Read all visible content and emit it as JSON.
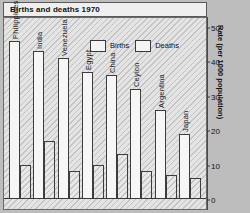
{
  "title": "Births and deaths 1970",
  "legend": {
    "position": "top-center",
    "items": [
      {
        "label": "Births",
        "swatch": "births-swatch"
      },
      {
        "label": "Deaths",
        "swatch": "deaths-swatch"
      }
    ]
  },
  "axis": {
    "ylabel": "Rate (per 1000 population)",
    "ticks": [
      "0",
      "10",
      "20",
      "30",
      "40",
      "50"
    ]
  },
  "chart_data": {
    "type": "bar",
    "title": "Births and deaths 1970",
    "xlabel": "",
    "ylabel": "Rate (per 1000 population)",
    "ylim": [
      0,
      50
    ],
    "yticks": [
      0,
      10,
      20,
      30,
      40,
      50
    ],
    "grid": false,
    "legend_position": "top-center",
    "categories": [
      "Philippines",
      "India",
      "Venezuela",
      "Egypt",
      "China",
      "Ceylon",
      "Argentina",
      "Japan"
    ],
    "series": [
      {
        "name": "Births",
        "values": [
          46,
          43,
          41,
          37,
          36,
          32,
          26,
          19
        ]
      },
      {
        "name": "Deaths",
        "values": [
          10,
          17,
          8,
          10,
          13,
          8,
          7,
          6
        ]
      }
    ]
  }
}
